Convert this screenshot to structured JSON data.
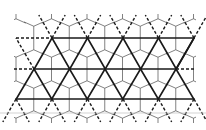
{
  "diagram": {
    "title": "Triangular lattice overlaid on pentagonal tiling",
    "colors": {
      "lattice": "#1a1a1a",
      "tiling": "#4a4a4a",
      "rule": "#c8c8c8",
      "background": "#ffffff"
    },
    "lattice": {
      "rows_y": [
        38,
        69,
        99
      ],
      "dx": 35.5,
      "row_vertices_x": [
        [
          52,
          87.5,
          123,
          158.5,
          194
        ],
        [
          34,
          69.5,
          105,
          140.5,
          176
        ],
        [
          16,
          52,
          87.5,
          123,
          158.5,
          194
        ]
      ],
      "solid_horizontals": [
        {
          "x1": 52,
          "x2": 194,
          "y": 38
        },
        {
          "x1": 34,
          "x2": 176,
          "y": 69
        },
        {
          "x1": 16,
          "x2": 194,
          "y": 99
        }
      ],
      "dashed_horizontals": [
        {
          "x1": 16,
          "x2": 52,
          "y": 38
        },
        {
          "x1": 14,
          "x2": 34,
          "y": 69
        },
        {
          "x1": 176,
          "x2": 196,
          "y": 69
        }
      ],
      "top_extension_y": 15,
      "bottom_extension_y": 122
    },
    "rule_line": {
      "y": 113,
      "x1": 0,
      "x2": 206
    }
  }
}
